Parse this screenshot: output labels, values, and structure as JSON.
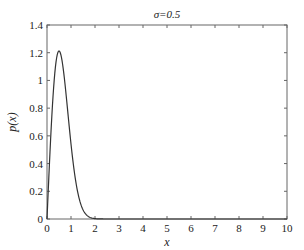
{
  "chart_data": {
    "type": "line",
    "title": "σ=0.5",
    "xlabel": "x",
    "ylabel": "p(x)",
    "xlim": [
      0,
      10
    ],
    "ylim": [
      0,
      1.4
    ],
    "grid": false,
    "legend": null,
    "x_ticks": [
      "0",
      "1",
      "2",
      "3",
      "4",
      "5",
      "6",
      "7",
      "8",
      "9",
      "10"
    ],
    "y_ticks": [
      "0",
      "0.2",
      "0.4",
      "0.6",
      "0.8",
      "1",
      "1.2",
      "1.4"
    ],
    "series": [
      {
        "name": "p(x)",
        "formula": "(x/σ²)·exp(-x²/(2σ²)), σ=0.5",
        "x": [
          0,
          0.1,
          0.2,
          0.3,
          0.4,
          0.5,
          0.6,
          0.7,
          0.8,
          0.9,
          1.0,
          1.2,
          1.4,
          1.6,
          1.8,
          2.0,
          2.5,
          3,
          4,
          5,
          6,
          7,
          8,
          9,
          10
        ],
        "values": [
          0,
          0.392,
          0.738,
          1.003,
          1.162,
          1.213,
          1.162,
          1.053,
          0.887,
          0.712,
          0.541,
          0.27,
          0.111,
          0.037,
          0.011,
          0.003,
          0.0,
          0.0,
          0,
          0,
          0,
          0,
          0,
          0,
          0
        ]
      }
    ],
    "colors": {
      "line": "#333333",
      "axes": "#555555"
    }
  }
}
